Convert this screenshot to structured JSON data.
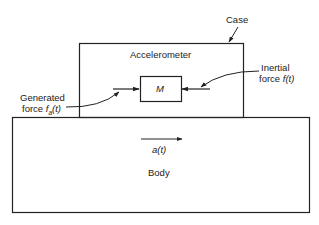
{
  "diagram": {
    "type": "block-diagram",
    "labels": {
      "case": "Case",
      "accelerometer": "Accelerometer",
      "mass": "M",
      "generated_line1": "Generated",
      "generated_line2_prefix": "force ",
      "generated_symbol": "f",
      "generated_subscript": "a",
      "generated_suffix": "(t)",
      "inertial_line1": "Inertial",
      "inertial_line2_prefix": "force ",
      "inertial_symbol": "f(t)",
      "acceleration": "a(t)",
      "body": "Body"
    },
    "nodes": [
      {
        "id": "case",
        "label": "Case / Accelerometer",
        "shape": "rectangle"
      },
      {
        "id": "mass",
        "label": "M",
        "shape": "rectangle"
      },
      {
        "id": "body",
        "label": "Body",
        "shape": "rectangle"
      }
    ],
    "edges": [
      {
        "from": "generated-force",
        "to": "mass",
        "label": "Generated force f_a(t)",
        "direction": "right"
      },
      {
        "from": "inertial-force",
        "to": "mass",
        "label": "Inertial force f(t)",
        "direction": "left"
      },
      {
        "from": "body",
        "to": "body",
        "label": "a(t)",
        "direction": "right"
      }
    ],
    "colors": {
      "stroke": "#222222",
      "background": "#ffffff"
    }
  }
}
